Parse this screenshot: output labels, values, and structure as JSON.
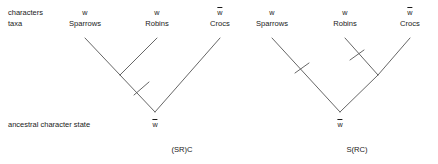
{
  "figure": {
    "row_labels": {
      "characters": "characters",
      "taxa": "taxa",
      "ancestral": "ancestral character state"
    },
    "trees": [
      {
        "id": "left-tree",
        "caption": "(SR)C",
        "root_state": "w",
        "root_state_overbar": true,
        "leaves": [
          {
            "taxon": "Sparrows",
            "state": "w",
            "overbar": false
          },
          {
            "taxon": "Robins",
            "state": "w",
            "overbar": false
          },
          {
            "taxon": "Crocs",
            "state": "w",
            "overbar": true
          }
        ],
        "change_marks": 1
      },
      {
        "id": "right-tree",
        "caption": "S(RC)",
        "root_state": "w",
        "root_state_overbar": true,
        "leaves": [
          {
            "taxon": "Sparrows",
            "state": "w",
            "overbar": false
          },
          {
            "taxon": "Robins",
            "state": "w",
            "overbar": false
          },
          {
            "taxon": "Crocs",
            "state": "w",
            "overbar": true
          }
        ],
        "change_marks": 2
      }
    ],
    "colors": {
      "line": "#4d4d4d",
      "text": "#1a1a1a",
      "background": "#ffffff"
    }
  }
}
